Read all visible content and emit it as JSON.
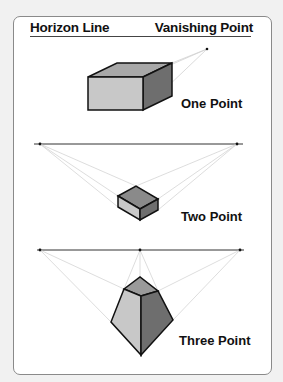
{
  "header": {
    "left_label": "Horizon Line",
    "right_label": "Vanishing Point"
  },
  "panels": [
    {
      "label": "One Point",
      "vanishing_points": [
        [
          207,
          49
        ]
      ]
    },
    {
      "label": "Two Point",
      "horizon_y": 144,
      "vanishing_points": [
        [
          40,
          144
        ],
        [
          237,
          144
        ]
      ]
    },
    {
      "label": "Three Point",
      "horizon_y": 250,
      "vanishing_points": [
        [
          40,
          250
        ],
        [
          140,
          250
        ],
        [
          240,
          250
        ]
      ]
    }
  ],
  "colors": {
    "light_face": "#c8c8c8",
    "mid_face": "#9a9a9a",
    "dark_face": "#6e6e6e",
    "guide_line": "#cfcfcf",
    "outline": "#111111"
  }
}
